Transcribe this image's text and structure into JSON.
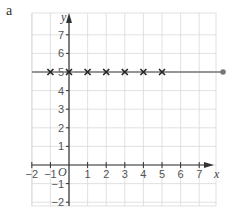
{
  "panel_label": "a",
  "chart_data": {
    "type": "scatter",
    "title": "",
    "xlabel": "x",
    "ylabel": "y",
    "origin_label": "O",
    "xlim": [
      -2,
      8
    ],
    "ylim": [
      -2,
      8
    ],
    "grid": true,
    "x_ticks": [
      -2,
      -1,
      1,
      2,
      3,
      4,
      5,
      6,
      7
    ],
    "y_ticks": [
      -2,
      -1,
      1,
      2,
      3,
      4,
      5,
      6,
      7
    ],
    "series": [
      {
        "name": "points",
        "marker": "x",
        "x": [
          -1,
          0,
          1,
          2,
          3,
          4,
          5
        ],
        "y": [
          5,
          5,
          5,
          5,
          5,
          5,
          5
        ]
      }
    ],
    "lines": [
      {
        "name": "y = 5",
        "equation": "y = 5",
        "x_start": -2,
        "x_end": 8,
        "end_marker": "dot"
      }
    ],
    "colors": {
      "grid": "#d9d9d9",
      "axis": "#333333",
      "line": "#777777",
      "marker": "#222222"
    }
  }
}
